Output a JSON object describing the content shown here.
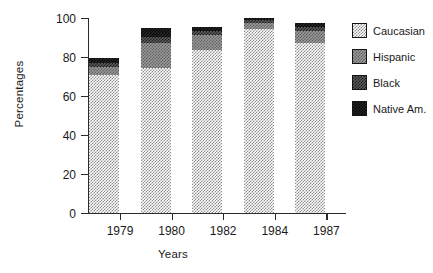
{
  "chart_data": {
    "type": "bar",
    "stacked": true,
    "title": "",
    "xlabel": "Years",
    "ylabel": "Percentages",
    "categories": [
      "1979",
      "1980",
      "1982",
      "1984",
      "1987"
    ],
    "ylim": [
      0,
      100
    ],
    "yticks": [
      0,
      20,
      40,
      60,
      80,
      100
    ],
    "ytick_labels": [
      "0",
      "20",
      "40",
      "60",
      "80",
      "100"
    ],
    "grid": false,
    "legend_position": "right",
    "series": [
      {
        "name": "Caucasian",
        "pattern": "light-dither",
        "color": "#c8c8c8",
        "values": [
          71,
          74.5,
          83.5,
          94.5,
          87
        ]
      },
      {
        "name": "Hispanic",
        "pattern": "medium-dither",
        "color": "#8f8f8f",
        "values": [
          4,
          12.5,
          8,
          3,
          6.5
        ]
      },
      {
        "name": "Black",
        "pattern": "dark-dither",
        "color": "#4d4d4d",
        "values": [
          2,
          3.5,
          2,
          1.5,
          2
        ]
      },
      {
        "name": "Native Am.",
        "pattern": "solid-dark",
        "color": "#1a1a1a",
        "values": [
          2.5,
          4.5,
          2,
          1,
          2
        ]
      }
    ],
    "totals": [
      79.5,
      95,
      95.5,
      100,
      97.5
    ]
  },
  "axes": {
    "y_title": "Percentages",
    "x_title": "Years"
  },
  "legend": {
    "items": [
      {
        "label": "Caucasian"
      },
      {
        "label": "Hispanic"
      },
      {
        "label": "Black"
      },
      {
        "label": "Native Am."
      }
    ]
  }
}
